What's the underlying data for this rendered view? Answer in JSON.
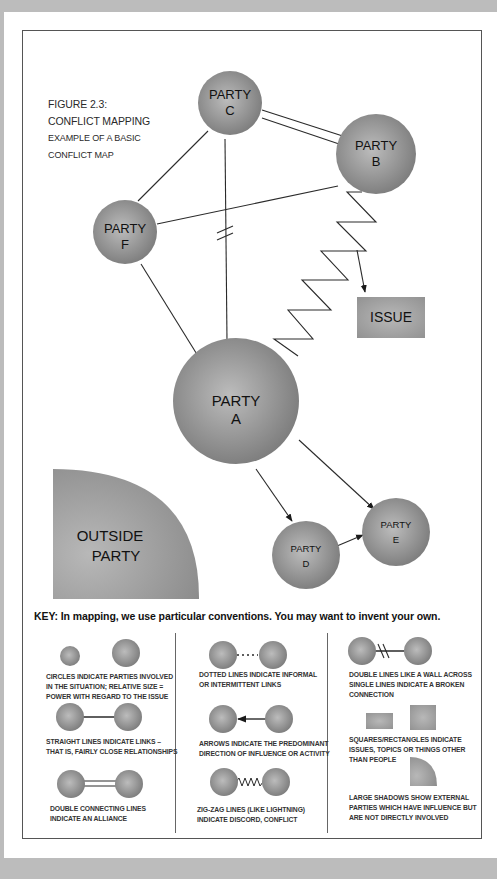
{
  "figure": {
    "label": "FIGURE 2.3:",
    "title": "CONFLICT MAPPING",
    "subtitle_line1": "EXAMPLE OF A BASIC",
    "subtitle_line2": "CONFLICT MAP"
  },
  "nodes": {
    "party_a": {
      "line1": "PARTY",
      "line2": "A"
    },
    "party_b": {
      "line1": "PARTY",
      "line2": "B"
    },
    "party_c": {
      "line1": "PARTY",
      "line2": "C"
    },
    "party_d": {
      "line1": "PARTY",
      "line2": "D"
    },
    "party_e": {
      "line1": "PARTY",
      "line2": "E"
    },
    "party_f": {
      "line1": "PARTY",
      "line2": "F"
    },
    "issue": {
      "label": "ISSUE"
    },
    "outside_party": {
      "line1": "OUTSIDE",
      "line2": "PARTY"
    }
  },
  "relationships": [
    {
      "from": "C",
      "to": "B",
      "type": "double line (alliance)"
    },
    {
      "from": "C",
      "to": "F",
      "type": "straight line"
    },
    {
      "from": "C",
      "to": "A",
      "type": "broken connection"
    },
    {
      "from": "F",
      "to": "B",
      "type": "straight line"
    },
    {
      "from": "F",
      "to": "A",
      "type": "straight line"
    },
    {
      "from": "B",
      "to": "A",
      "type": "zig-zag (conflict)"
    },
    {
      "from": "B",
      "to": "ISSUE",
      "type": "arrow"
    },
    {
      "from": "A",
      "to": "D",
      "type": "arrow"
    },
    {
      "from": "A",
      "to": "E",
      "type": "arrow"
    },
    {
      "from": "D",
      "to": "E",
      "type": "arrow"
    }
  ],
  "key": {
    "heading": "KEY:  In mapping, we use particular conventions. You may want to invent your own.",
    "items": [
      {
        "line1": "CIRCLES INDICATE PARTIES INVOLVED",
        "line2": "IN THE SITUATION; RELATIVE SIZE =",
        "line3": "POWER WITH REGARD TO THE ISSUE"
      },
      {
        "line1": "STRAIGHT LINES INDICATE LINKS –",
        "line2": "THAT IS, FAIRLY CLOSE RELATIONSHIPS"
      },
      {
        "line1": "DOUBLE CONNECTING LINES",
        "line2": "INDICATE AN ALLIANCE"
      },
      {
        "line1": "DOTTED LINES INDICATE INFORMAL",
        "line2": "OR INTERMITTENT LINKS"
      },
      {
        "line1": "ARROWS INDICATE THE PREDOMINANT",
        "line2": "DIRECTION OF INFLUENCE OR ACTIVITY"
      },
      {
        "line1": "ZIG-ZAG LINES (LIKE LIGHTNING)",
        "line2": "INDICATE DISCORD, CONFLICT"
      },
      {
        "line1": "DOUBLE LINES LIKE A WALL ACROSS",
        "line2": "SINGLE LINES INDICATE A BROKEN",
        "line3": "CONNECTION"
      },
      {
        "line1": "SQUARES/RECTANGLES INDICATE",
        "line2": "ISSUES, TOPICS OR THINGS OTHER",
        "line3": "THAN PEOPLE"
      },
      {
        "line1": "LARGE SHADOWS SHOW EXTERNAL",
        "line2": "PARTIES WHICH HAVE INFLUENCE BUT",
        "line3": "ARE NOT DIRECTLY INVOLVED"
      }
    ]
  },
  "colors": {
    "background": "#bcbcbc",
    "node_fill_light": "#b4b4b4",
    "node_fill_dark": "#7e7e7e",
    "line": "#2a2a2a"
  }
}
